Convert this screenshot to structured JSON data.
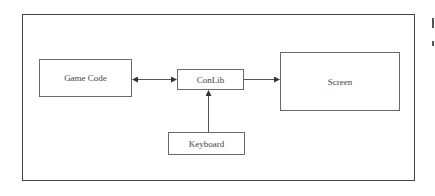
{
  "diagram": {
    "title": "",
    "nodes": [
      {
        "id": "game_code",
        "label": "Game Code"
      },
      {
        "id": "conlib",
        "label": "ConLib"
      },
      {
        "id": "screen",
        "label": "Screen"
      },
      {
        "id": "keyboard",
        "label": "Keyboard"
      }
    ],
    "edges": [
      {
        "from": "game_code",
        "to": "conlib",
        "direction": "bidirectional"
      },
      {
        "from": "conlib",
        "to": "screen",
        "direction": "forward"
      },
      {
        "from": "keyboard",
        "to": "conlib",
        "direction": "forward"
      }
    ],
    "colors": {
      "frame": "#444444",
      "node_border": "#6a6a6a",
      "edge": "#555555",
      "text": "#444444",
      "background": "#ffffff"
    }
  }
}
